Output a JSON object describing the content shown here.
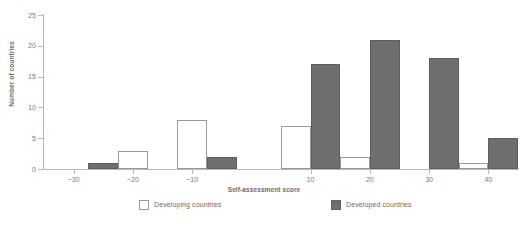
{
  "chart_data": {
    "type": "bar",
    "title": "",
    "subtitle": "",
    "xlabel": "Self-assessment score",
    "ylabel": "Number of countries",
    "xlim": [
      -35,
      45
    ],
    "ylim": [
      0,
      25
    ],
    "y_ticks": [
      0,
      5,
      10,
      15,
      20,
      25
    ],
    "x_ticks": [
      -30,
      -20,
      -10,
      10,
      20,
      30,
      40
    ],
    "x_tick_labels": [
      "−30",
      "−20",
      "−10",
      "10",
      "20",
      "30",
      "40"
    ],
    "grid": false,
    "legend_position": "bottom",
    "bin_width": 10,
    "categories": [
      "−30",
      "−20",
      "−10",
      "10",
      "20",
      "30",
      "40"
    ],
    "bins": [
      {
        "label": "−30",
        "left": -32.5,
        "right": -22.5
      },
      {
        "label": "−20",
        "left": -22.5,
        "right": -12.5
      },
      {
        "label": "−10",
        "left": -12.5,
        "right": -2.5
      },
      {
        "label": "10",
        "left": 5.0,
        "right": 15.0
      },
      {
        "label": "20",
        "left": 15.0,
        "right": 25.0
      },
      {
        "label": "30",
        "left": 25.0,
        "right": 35.0
      },
      {
        "label": "40",
        "left": 35.0,
        "right": 45.0
      }
    ],
    "series": [
      {
        "name": "Developing countries",
        "color": "#ffffff",
        "edge_color": "#9a9a9a",
        "values": [
          0,
          3,
          8,
          7,
          2,
          0,
          1
        ]
      },
      {
        "name": "Developed countries",
        "color": "#706f6f",
        "edge_color": "#5e5e5e",
        "values": [
          1,
          0,
          2,
          17,
          21,
          18,
          5
        ]
      }
    ]
  },
  "legend": {
    "items": [
      {
        "label": "Developing countries",
        "swatch": "white-square-outline"
      },
      {
        "label": "Developed countries",
        "swatch": "gray-filled-square"
      }
    ]
  },
  "axes": {
    "y_title": "Number of countries",
    "x_title": "Self-assessment score",
    "y_tick_labels": [
      "0",
      "5",
      "10",
      "15",
      "20",
      "25"
    ],
    "x_tick_labels": [
      "−30",
      "−20",
      "−10",
      "10",
      "20",
      "30",
      "40"
    ]
  },
  "colors": {
    "developed_fill": "#706f6f",
    "developing_fill": "#ffffff",
    "bar_edge": "#9a9a9a",
    "axis": "#b8b8b8",
    "text": "#6b6b6b",
    "background": "#ffffff"
  }
}
